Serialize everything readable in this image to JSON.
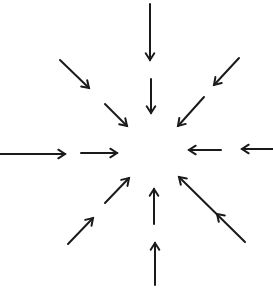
{
  "diagram": {
    "width": 273,
    "height": 288,
    "stroke_color": "#1a1a1a",
    "background": "#ffffff",
    "center": [
      153,
      150
    ],
    "arrows": [
      {
        "id": "top-outer",
        "direction": "down",
        "from": [
          150,
          4
        ],
        "to": [
          150,
          60
        ],
        "heads": [
          [
            150,
            60
          ]
        ]
      },
      {
        "id": "top-inner",
        "direction": "down",
        "from": [
          151,
          79
        ],
        "to": [
          151,
          113
        ],
        "heads": [
          [
            151,
            113
          ]
        ]
      },
      {
        "id": "upper-left-outer",
        "direction": "down-right",
        "from": [
          60,
          60
        ],
        "to": [
          89,
          88
        ],
        "heads": [
          [
            89,
            88
          ]
        ]
      },
      {
        "id": "upper-left-inner",
        "direction": "down-right",
        "from": [
          105,
          104
        ],
        "to": [
          127,
          126
        ],
        "heads": [
          [
            127,
            126
          ]
        ]
      },
      {
        "id": "upper-right-outer",
        "direction": "down-left",
        "from": [
          239,
          58
        ],
        "to": [
          214,
          85
        ],
        "heads": [
          [
            214,
            85
          ]
        ]
      },
      {
        "id": "upper-right-inner",
        "direction": "down-left",
        "from": [
          204,
          97
        ],
        "to": [
          178,
          126
        ],
        "heads": [
          [
            178,
            126
          ]
        ]
      },
      {
        "id": "left-outer",
        "direction": "right",
        "from": [
          0,
          154
        ],
        "to": [
          65,
          154
        ],
        "heads": [
          [
            65,
            154
          ]
        ]
      },
      {
        "id": "left-inner",
        "direction": "right",
        "from": [
          81,
          153
        ],
        "to": [
          117,
          153
        ],
        "heads": [
          [
            117,
            153
          ]
        ]
      },
      {
        "id": "right-inner",
        "direction": "left",
        "from": [
          221,
          150
        ],
        "to": [
          189,
          150
        ],
        "heads": [
          [
            189,
            150
          ]
        ]
      },
      {
        "id": "right-outer",
        "direction": "left",
        "from": [
          273,
          149
        ],
        "to": [
          242,
          149
        ],
        "heads": [
          [
            242,
            149
          ]
        ]
      },
      {
        "id": "lower-left-outer",
        "direction": "up-right",
        "from": [
          68,
          244
        ],
        "to": [
          93,
          218
        ],
        "heads": [
          [
            93,
            218
          ]
        ]
      },
      {
        "id": "lower-left-inner",
        "direction": "up-right",
        "from": [
          105,
          203
        ],
        "to": [
          129,
          178
        ],
        "heads": [
          [
            129,
            178
          ]
        ]
      },
      {
        "id": "bottom-inner",
        "direction": "up",
        "from": [
          154,
          224
        ],
        "to": [
          154,
          189
        ],
        "heads": [
          [
            154,
            189
          ]
        ]
      },
      {
        "id": "bottom-outer",
        "direction": "up",
        "from": [
          155,
          285
        ],
        "to": [
          155,
          243
        ],
        "heads": [
          [
            155,
            243
          ]
        ]
      },
      {
        "id": "lower-right",
        "direction": "up-left",
        "from": [
          245,
          242
        ],
        "to": [
          179,
          177
        ],
        "heads": [
          [
            179,
            177
          ],
          [
            217,
            214
          ]
        ]
      }
    ]
  }
}
